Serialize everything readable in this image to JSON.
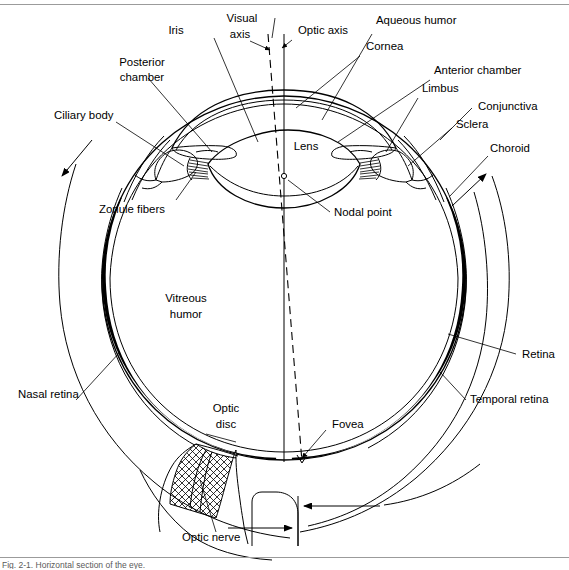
{
  "figure": {
    "caption": "Fig. 2-1. Horizontal section of the eye.",
    "domain": "Diagram",
    "colors": {
      "ink": "#000000",
      "background": "#ffffff",
      "rule": "#9b9b9b",
      "retina_fill": "#000000"
    }
  },
  "labels": {
    "iris": "Iris",
    "visual_axis": "Visual\naxis",
    "visual_axis_line1": "Visual",
    "visual_axis_line2": "axis",
    "optic_axis": "Optic axis",
    "aqueous_humor": "Aqueous humor",
    "cornea": "Cornea",
    "anterior_chamber": "Anterior chamber",
    "limbus": "Limbus",
    "conjunctiva": "Conjunctiva",
    "sclera": "Sclera",
    "choroid": "Choroid",
    "posterior_chamber_line1": "Posterior",
    "posterior_chamber_line2": "chamber",
    "ciliary_body": "Ciliary body",
    "zonule_fibers": "Zonule fibers",
    "lens": "Lens",
    "nodal_point": "Nodal point",
    "vitreous_humor_line1": "Vitreous",
    "vitreous_humor_line2": "humor",
    "nasal_retina": "Nasal retina",
    "retina": "Retina",
    "temporal_retina": "Temporal retina",
    "optic_disc_line1": "Optic",
    "optic_disc_line2": "disc",
    "fovea": "Fovea",
    "optic_nerve": "Optic nerve"
  },
  "structures": [
    {
      "name": "iris",
      "label": "Iris"
    },
    {
      "name": "visual-axis",
      "label": "Visual axis"
    },
    {
      "name": "optic-axis",
      "label": "Optic axis"
    },
    {
      "name": "aqueous-humor",
      "label": "Aqueous humor"
    },
    {
      "name": "cornea",
      "label": "Cornea"
    },
    {
      "name": "anterior-chamber",
      "label": "Anterior chamber"
    },
    {
      "name": "limbus",
      "label": "Limbus"
    },
    {
      "name": "conjunctiva",
      "label": "Conjunctiva"
    },
    {
      "name": "sclera",
      "label": "Sclera"
    },
    {
      "name": "choroid",
      "label": "Choroid"
    },
    {
      "name": "posterior-chamber",
      "label": "Posterior chamber"
    },
    {
      "name": "ciliary-body",
      "label": "Ciliary body"
    },
    {
      "name": "zonule-fibers",
      "label": "Zonule fibers"
    },
    {
      "name": "lens",
      "label": "Lens"
    },
    {
      "name": "nodal-point",
      "label": "Nodal point"
    },
    {
      "name": "vitreous-humor",
      "label": "Vitreous humor"
    },
    {
      "name": "nasal-retina",
      "label": "Nasal retina"
    },
    {
      "name": "retina",
      "label": "Retina"
    },
    {
      "name": "temporal-retina",
      "label": "Temporal retina"
    },
    {
      "name": "optic-disc",
      "label": "Optic disc"
    },
    {
      "name": "fovea",
      "label": "Fovea"
    },
    {
      "name": "optic-nerve",
      "label": "Optic nerve"
    }
  ]
}
